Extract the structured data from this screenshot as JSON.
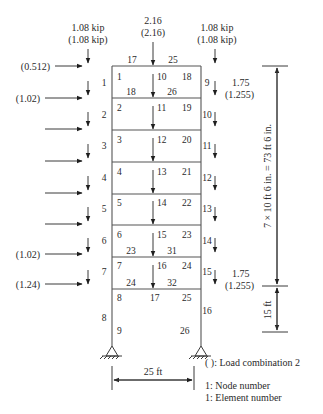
{
  "figure": {
    "top_loads": {
      "left": {
        "line1": "1.08 kip",
        "line2": "(1.08 kip)"
      },
      "center": {
        "line1": "2.16",
        "line2": "(2.16)"
      },
      "right": {
        "line1": "1.08 kip",
        "line2": "(1.08 kip)"
      }
    },
    "lateral_loads": [
      {
        "label": "(0.512)"
      },
      {
        "label": "(1.02)"
      },
      {
        "label": ""
      },
      {
        "label": ""
      },
      {
        "label": ""
      },
      {
        "label": "(1.02)"
      },
      {
        "label": "(1.24)"
      }
    ],
    "right_vertical_load_top": {
      "line1": "1.75",
      "line2": "(1.255)"
    },
    "right_vertical_load_bottom": {
      "line1": "1.75",
      "line2": "(1.255)"
    },
    "left_column_elements": [
      "1",
      "2",
      "3",
      "4",
      "5",
      "6",
      "7",
      "8"
    ],
    "right_column_elements": [
      "9",
      "10",
      "11",
      "12",
      "13",
      "14",
      "15",
      "16"
    ],
    "left_nodes": [
      "1",
      "2",
      "3",
      "4",
      "5",
      "6",
      "7",
      "8",
      "9"
    ],
    "center_nodes": [
      "10",
      "11",
      "12",
      "13",
      "14",
      "15",
      "16",
      "17"
    ],
    "right_nodes": [
      "18",
      "19",
      "20",
      "21",
      "22",
      "23",
      "24",
      "25",
      "26"
    ],
    "beam_labels": {
      "roof_left": "17",
      "roof_right": "25",
      "floor1_left": "18",
      "floor1_right": "26",
      "floor6_left": "23",
      "floor6_right": "31",
      "floor7_left": "24",
      "floor7_right": "32"
    },
    "dimensions": {
      "upper_height": "7 × 10 ft 6 in. = 73 ft 6 in.",
      "lower_height": "15 ft",
      "bay_width": "25 ft"
    },
    "legend": {
      "load_combo": "( ): Load combination 2",
      "node_number": "1: Node number",
      "element_number": "1: Element number"
    }
  }
}
